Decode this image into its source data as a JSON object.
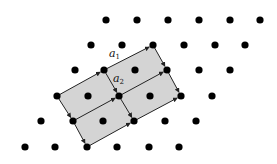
{
  "diagram": {
    "type": "lattice",
    "colors": {
      "dot": "#000000",
      "fill": "#d4d4d4",
      "edge": "#222222",
      "background": "#ffffff"
    },
    "dot_radius": 3.6,
    "rows": [
      {
        "y": 20,
        "x": [
          106,
          137,
          168,
          199,
          230,
          260
        ]
      },
      {
        "y": 45,
        "x": [
          91,
          122,
          153,
          184,
          215,
          245
        ]
      },
      {
        "y": 70,
        "x": [
          75,
          104,
          135,
          167,
          199,
          230
        ]
      },
      {
        "y": 96,
        "x": [
          57,
          88,
          119,
          150,
          181,
          212
        ]
      },
      {
        "y": 121,
        "x": [
          41,
          73,
          103,
          134,
          165,
          196
        ]
      },
      {
        "y": 147,
        "x": [
          25,
          55,
          87,
          117,
          149,
          179
        ]
      }
    ],
    "cells": [
      [
        [
          104,
          70
        ],
        [
          153,
          45
        ],
        [
          167,
          70
        ],
        [
          119,
          96
        ]
      ],
      [
        [
          119,
          96
        ],
        [
          167,
          70
        ],
        [
          181,
          96
        ],
        [
          134,
          121
        ]
      ],
      [
        [
          57,
          96
        ],
        [
          104,
          70
        ],
        [
          119,
          96
        ],
        [
          73,
          121
        ]
      ],
      [
        [
          73,
          121
        ],
        [
          119,
          96
        ],
        [
          134,
          121
        ],
        [
          87,
          147
        ]
      ]
    ],
    "vectors_a1": [
      [
        [
          104,
          70
        ],
        [
          153,
          45
        ]
      ],
      [
        [
          119,
          96
        ],
        [
          167,
          70
        ]
      ],
      [
        [
          134,
          121
        ],
        [
          181,
          96
        ]
      ],
      [
        [
          57,
          96
        ],
        [
          104,
          70
        ]
      ],
      [
        [
          73,
          121
        ],
        [
          119,
          96
        ]
      ],
      [
        [
          87,
          147
        ],
        [
          134,
          121
        ]
      ]
    ],
    "vectors_a2": [
      [
        [
          104,
          70
        ],
        [
          119,
          96
        ]
      ],
      [
        [
          153,
          45
        ],
        [
          167,
          70
        ]
      ],
      [
        [
          119,
          96
        ],
        [
          134,
          121
        ]
      ],
      [
        [
          167,
          70
        ],
        [
          181,
          96
        ]
      ],
      [
        [
          57,
          96
        ],
        [
          73,
          121
        ]
      ],
      [
        [
          73,
          121
        ],
        [
          87,
          147
        ]
      ]
    ],
    "labels": [
      {
        "id": "a1",
        "text": "a",
        "sub": "1",
        "x": 109,
        "y": 57
      },
      {
        "id": "a2",
        "text": "a",
        "sub": "2",
        "x": 113,
        "y": 82
      }
    ]
  }
}
